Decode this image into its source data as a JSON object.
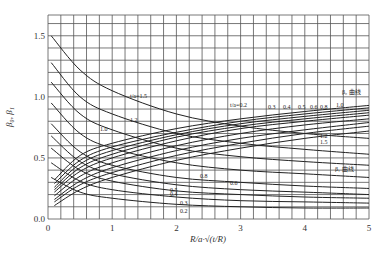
{
  "chart_data": {
    "type": "line",
    "title": "",
    "xlabel": "R/a·√(t/R)",
    "ylabel": "β₀, β₁",
    "xlim": [
      0,
      5
    ],
    "ylim": [
      0,
      1.65
    ],
    "grid": true,
    "x_ticks": [
      "0",
      "1",
      "2",
      "3",
      "4",
      "5"
    ],
    "y_ticks": [
      "0.0",
      "0.5",
      "1.0",
      "1.5"
    ],
    "annotations": [
      "β₀ 曲线",
      "β₁ 曲线",
      "t/a=1.5",
      "t/a=0.2"
    ],
    "series_beta0": [
      {
        "name": "t/a=1.5",
        "x": [
          0.05,
          0.5,
          1,
          2,
          3,
          4,
          5
        ],
        "values": [
          1.5,
          1.22,
          1.05,
          0.86,
          0.76,
          0.7,
          0.66
        ]
      },
      {
        "name": "t/a=1.2",
        "x": [
          0.05,
          0.5,
          1,
          2,
          3,
          4,
          5
        ],
        "values": [
          1.28,
          1.0,
          0.86,
          0.7,
          0.62,
          0.57,
          0.53
        ]
      },
      {
        "name": "t/a=1.0",
        "x": [
          0.05,
          0.5,
          1,
          2,
          3,
          4,
          5
        ],
        "values": [
          1.12,
          0.86,
          0.73,
          0.58,
          0.51,
          0.47,
          0.44
        ]
      },
      {
        "name": "t/a=0.8",
        "x": [
          0.05,
          0.5,
          1,
          2,
          3,
          4,
          5
        ],
        "values": [
          0.95,
          0.7,
          0.58,
          0.46,
          0.4,
          0.37,
          0.34
        ]
      },
      {
        "name": "t/a=0.6",
        "x": [
          0.05,
          0.5,
          1,
          2,
          3,
          4,
          5
        ],
        "values": [
          0.78,
          0.55,
          0.44,
          0.34,
          0.3,
          0.27,
          0.25
        ]
      },
      {
        "name": "t/a=0.5",
        "x": [
          0.05,
          0.5,
          1,
          2,
          3,
          4,
          5
        ],
        "values": [
          0.68,
          0.47,
          0.37,
          0.28,
          0.24,
          0.22,
          0.2
        ]
      },
      {
        "name": "t/a=0.4",
        "x": [
          0.05,
          0.5,
          1,
          2,
          3,
          4,
          5
        ],
        "values": [
          0.58,
          0.4,
          0.31,
          0.23,
          0.2,
          0.18,
          0.17
        ]
      },
      {
        "name": "t/a=0.3",
        "x": [
          0.05,
          0.5,
          1,
          2,
          3,
          4,
          5
        ],
        "values": [
          0.46,
          0.31,
          0.24,
          0.18,
          0.15,
          0.14,
          0.13
        ]
      },
      {
        "name": "t/a=0.2",
        "x": [
          0.05,
          0.5,
          1,
          2,
          3,
          4,
          5
        ],
        "values": [
          0.34,
          0.22,
          0.17,
          0.12,
          0.1,
          0.09,
          0.09
        ]
      }
    ],
    "series_beta1": [
      {
        "name": "t/a=0.2",
        "x": [
          0.1,
          0.5,
          1,
          2,
          3,
          4,
          5
        ],
        "values": [
          0.32,
          0.52,
          0.62,
          0.74,
          0.82,
          0.88,
          0.93
        ]
      },
      {
        "name": "t/a=0.3",
        "x": [
          0.1,
          0.5,
          1,
          2,
          3,
          4,
          5
        ],
        "values": [
          0.29,
          0.48,
          0.59,
          0.71,
          0.8,
          0.86,
          0.91
        ]
      },
      {
        "name": "t/a=0.4",
        "x": [
          0.1,
          0.5,
          1,
          2,
          3,
          4,
          5
        ],
        "values": [
          0.26,
          0.45,
          0.56,
          0.69,
          0.78,
          0.84,
          0.89
        ]
      },
      {
        "name": "t/a=0.5",
        "x": [
          0.1,
          0.5,
          1,
          2,
          3,
          4,
          5
        ],
        "values": [
          0.24,
          0.42,
          0.53,
          0.67,
          0.76,
          0.82,
          0.87
        ]
      },
      {
        "name": "t/a=0.6",
        "x": [
          0.1,
          0.5,
          1,
          2,
          3,
          4,
          5
        ],
        "values": [
          0.22,
          0.39,
          0.5,
          0.64,
          0.74,
          0.8,
          0.85
        ]
      },
      {
        "name": "t/a=0.8",
        "x": [
          0.1,
          0.5,
          1,
          2,
          3,
          4,
          5
        ],
        "values": [
          0.19,
          0.35,
          0.46,
          0.6,
          0.7,
          0.77,
          0.82
        ]
      },
      {
        "name": "t/a=1.0",
        "x": [
          0.1,
          0.5,
          1,
          2,
          3,
          4,
          5
        ],
        "values": [
          0.16,
          0.31,
          0.42,
          0.56,
          0.66,
          0.73,
          0.79
        ]
      },
      {
        "name": "t/a=1.2",
        "x": [
          0.1,
          0.5,
          1,
          2,
          3,
          4,
          5
        ],
        "values": [
          0.14,
          0.28,
          0.38,
          0.52,
          0.62,
          0.7,
          0.76
        ]
      },
      {
        "name": "t/a=1.5",
        "x": [
          0.1,
          0.5,
          1,
          2,
          3,
          4,
          5
        ],
        "values": [
          0.11,
          0.24,
          0.34,
          0.48,
          0.58,
          0.66,
          0.72
        ]
      }
    ],
    "labels": {
      "beta0_curve": "β₀ 曲线",
      "beta1_curve": "β₁ 曲线",
      "ta15": "t/a=1.5",
      "ta02": "t/a=0.2",
      "b0": [
        "1.2",
        "1.0",
        "0.8",
        "0.6",
        "0.5",
        "0.4",
        "0.3",
        "0.2"
      ],
      "b1": [
        "0.3",
        "0.4",
        "0.5",
        "0.6",
        "0.8",
        "1.0",
        "1.2",
        "1.5"
      ]
    }
  }
}
